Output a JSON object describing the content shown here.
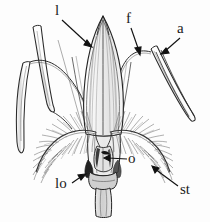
{
  "figure": {
    "background_color": "#fdfdfd",
    "ink_color": "#1a1a1a",
    "width": 210,
    "height": 222
  },
  "labels": [
    {
      "key": "l",
      "text": "l",
      "meaning": "lemma",
      "x": 55,
      "y": 4,
      "arrow": {
        "x1": 62,
        "y1": 20,
        "x2": 92,
        "y2": 47
      }
    },
    {
      "key": "f",
      "text": "f",
      "meaning": "filament",
      "x": 126,
      "y": 12,
      "arrow": {
        "x1": 131,
        "y1": 28,
        "x2": 140,
        "y2": 55
      }
    },
    {
      "key": "a",
      "text": "a",
      "meaning": "anther",
      "x": 177,
      "y": 22,
      "arrow": {
        "x1": 179,
        "y1": 38,
        "x2": 161,
        "y2": 54
      }
    },
    {
      "key": "o",
      "text": "o",
      "meaning": "ovary",
      "x": 128,
      "y": 153,
      "arrow": {
        "x1": 126,
        "y1": 159,
        "x2": 104,
        "y2": 158
      }
    },
    {
      "key": "lo",
      "text": "lo",
      "meaning": "lodicule",
      "x": 56,
      "y": 178,
      "arrow": {
        "x1": 72,
        "y1": 182,
        "x2": 85,
        "y2": 174
      }
    },
    {
      "key": "st",
      "text": "st",
      "meaning": "stigma",
      "x": 180,
      "y": 184,
      "arrow": {
        "x1": 180,
        "y1": 186,
        "x2": 152,
        "y2": 166
      }
    }
  ],
  "parts": {
    "lemma": "central pointed striated bract",
    "stigma_left": "feathery plume left",
    "stigma_right": "feathery plume right",
    "anther_left": "long curved anther left margin",
    "anther_right": "long curved anther right margin",
    "pedicel": "basal stalk"
  }
}
